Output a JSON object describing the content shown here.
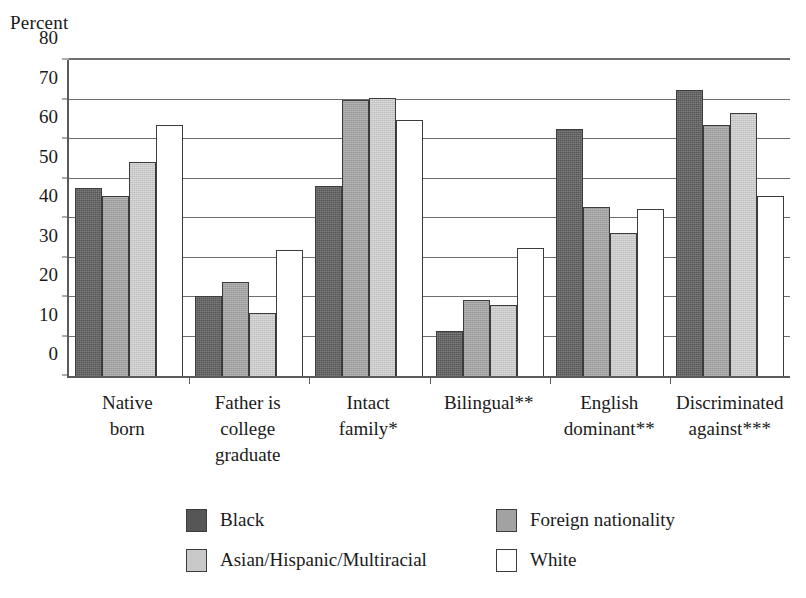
{
  "chart_data": {
    "type": "bar",
    "title": "",
    "ylabel": "Percent",
    "xlabel": "",
    "ylim": [
      0,
      80
    ],
    "yticks": [
      0,
      10,
      20,
      30,
      40,
      50,
      60,
      70,
      80
    ],
    "grid": true,
    "legend_position": "bottom",
    "categories": [
      "Native born",
      "Father is college graduate",
      "Intact family*",
      "Bilingual**",
      "English dominant**",
      "Discriminated against***"
    ],
    "category_lines": [
      [
        "Native",
        "born"
      ],
      [
        "Father is",
        "college",
        "graduate"
      ],
      [
        "Intact",
        "family*"
      ],
      [
        "Bilingual**"
      ],
      [
        "English",
        "dominant**"
      ],
      [
        "Discriminated",
        "against***"
      ]
    ],
    "series": [
      {
        "name": "Black",
        "color": "#565656",
        "values": [
          47.5,
          20.3,
          48.2,
          11.5,
          62.5,
          72.5
        ]
      },
      {
        "name": "Foreign nationality",
        "color": "#a2a2a2",
        "values": [
          45.6,
          23.8,
          70.0,
          19.3,
          42.7,
          63.5
        ]
      },
      {
        "name": "Asian/Hispanic/Multiracial",
        "color": "#c9c9c9",
        "values": [
          54.2,
          16.0,
          70.4,
          18.0,
          36.3,
          66.5
        ]
      },
      {
        "name": "White",
        "color": "#ffffff",
        "values": [
          63.5,
          31.8,
          64.8,
          32.3,
          42.4,
          45.6
        ]
      }
    ]
  },
  "legend": {
    "entries": [
      {
        "label": "Black",
        "swatch": "#565656"
      },
      {
        "label": "Foreign nationality",
        "swatch": "#a2a2a2"
      },
      {
        "label": "Asian/Hispanic/Multiracial",
        "swatch": "#c9c9c9"
      },
      {
        "label": "White",
        "swatch": "#ffffff"
      }
    ]
  }
}
